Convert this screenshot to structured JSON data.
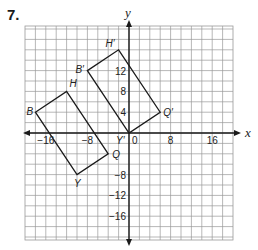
{
  "problem": {
    "number": "7."
  },
  "diagram": {
    "type": "coordinate-plane-translation",
    "axes": {
      "x_label": "x",
      "y_label": "y",
      "x_range": [
        -20,
        20
      ],
      "y_range": [
        -20,
        20
      ],
      "grid_step": 2,
      "x_ticks": [
        {
          "value": -16,
          "label": "−16"
        },
        {
          "value": -8,
          "label": "−8"
        },
        {
          "value": 0,
          "label": "0"
        },
        {
          "value": 8,
          "label": "8"
        },
        {
          "value": 16,
          "label": "16"
        }
      ],
      "y_ticks": [
        {
          "value": 12,
          "label": "12"
        },
        {
          "value": 8,
          "label": "8"
        },
        {
          "value": 4,
          "label": "4"
        },
        {
          "value": -8,
          "label": "−8"
        },
        {
          "value": -12,
          "label": "−12"
        },
        {
          "value": -16,
          "label": "−16"
        }
      ]
    },
    "figures": [
      {
        "name": "BHQY",
        "vertices": [
          {
            "label": "B",
            "x": -18,
            "y": 4
          },
          {
            "label": "H",
            "x": -12,
            "y": 8
          },
          {
            "label": "Q",
            "x": -4,
            "y": -4
          },
          {
            "label": "Y",
            "x": -10,
            "y": -8
          }
        ]
      },
      {
        "name": "B'H'Q'Y'",
        "vertices": [
          {
            "label": "B′",
            "x": -8,
            "y": 12
          },
          {
            "label": "H′",
            "x": -2,
            "y": 16
          },
          {
            "label": "Q′",
            "x": 6,
            "y": 4
          },
          {
            "label": "Y′",
            "x": 0,
            "y": 0
          }
        ]
      }
    ],
    "colors": {
      "grid": "#9a9a9a",
      "axis": "#1a1a1a",
      "figure": "#1a1a1a"
    }
  }
}
